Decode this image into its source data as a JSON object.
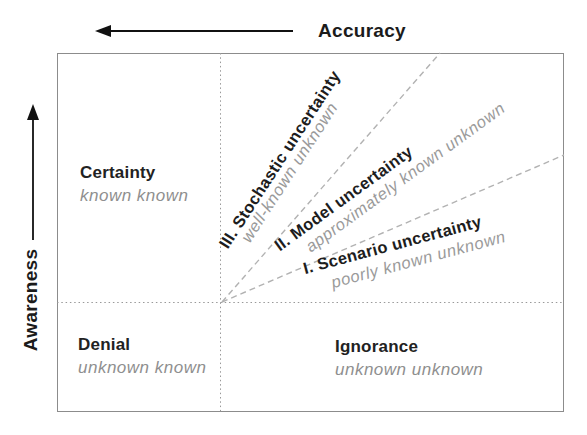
{
  "diagram": {
    "axes": {
      "x_label": "Accuracy",
      "y_label": "Awareness",
      "x_arrow_direction": "left",
      "y_arrow_direction": "up"
    },
    "quadrants": {
      "certainty": {
        "title": "Certainty",
        "subtitle": "known known"
      },
      "denial": {
        "title": "Denial",
        "subtitle": "unknown known"
      },
      "ignorance": {
        "title": "Ignorance",
        "subtitle": "unknown unknown"
      }
    },
    "wedges": [
      {
        "title": "III. Stochastic uncertainty",
        "subtitle": "well-known unknown"
      },
      {
        "title": "II. Model uncertainty",
        "subtitle": "approximately known unknown"
      },
      {
        "title": "I. Scenario uncertainty",
        "subtitle": "poorly known unknown"
      }
    ],
    "colors": {
      "title_text": "#1d1d1d",
      "subtitle_text": "#8f8f8f",
      "box_border": "#8c8c8c",
      "dotted_line": "#999999",
      "dashed_line": "#b2b2b2",
      "arrow": "#111111",
      "background": "#ffffff"
    }
  }
}
